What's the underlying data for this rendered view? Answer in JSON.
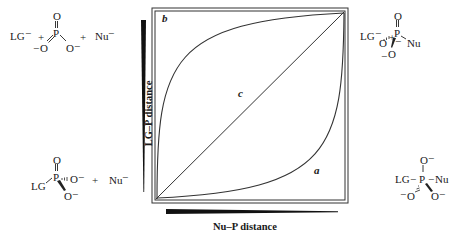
{
  "diagram": {
    "type": "More O'Ferrall-Jencks reaction coordinate diagram",
    "axes": {
      "x_label": "Nu–P distance",
      "y_label": "LG–P distance"
    },
    "curves": [
      {
        "id": "a",
        "label": "a",
        "description": "path through pentacoordinate intermediate (associative)"
      },
      {
        "id": "b",
        "label": "b",
        "description": "path through metaphosphate (dissociative)"
      },
      {
        "id": "c",
        "label": "c",
        "description": "concerted diagonal path"
      }
    ],
    "corners": {
      "top_left": {
        "parts": [
          "LG⁻",
          "+",
          "PO₃⁻",
          "+",
          "Nu⁻"
        ],
        "lg": "LG",
        "nu": "Nu",
        "charge": "−",
        "plus": "+",
        "atoms": {
          "P": "P",
          "O_top": "O",
          "O_left": "O",
          "O_right": "O"
        }
      },
      "top_right": {
        "lg": "LG",
        "nu": "Nu",
        "charge": "−",
        "plus": "+",
        "atoms": {
          "P": "P",
          "O_top": "O",
          "O_left": "O",
          "O_bottom": "O"
        }
      },
      "bottom_left": {
        "lg": "LG",
        "nu": "Nu",
        "charge": "−",
        "plus": "+",
        "atoms": {
          "P": "P",
          "O_top": "O",
          "O_right": "O",
          "O_bottom": "O"
        }
      },
      "bottom_right": {
        "lg": "LG",
        "nu": "Nu",
        "charge": "−",
        "atoms": {
          "P": "P",
          "O_top": "O",
          "O_left": "O",
          "O_right": "O"
        }
      }
    }
  }
}
